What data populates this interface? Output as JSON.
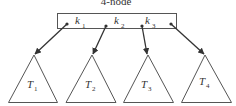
{
  "diagram": {
    "title": "4-node",
    "node": {
      "keys": [
        {
          "letter": "k",
          "sub": "1"
        },
        {
          "letter": "k",
          "sub": "2"
        },
        {
          "letter": "k",
          "sub": "3"
        }
      ]
    },
    "subtrees": [
      {
        "letter": "T",
        "sub": "1"
      },
      {
        "letter": "T",
        "sub": "2"
      },
      {
        "letter": "T",
        "sub": "3"
      },
      {
        "letter": "T",
        "sub": "4"
      }
    ],
    "colors": {
      "stroke": "#555555",
      "arrow": "#333333",
      "text": "#333333"
    }
  }
}
